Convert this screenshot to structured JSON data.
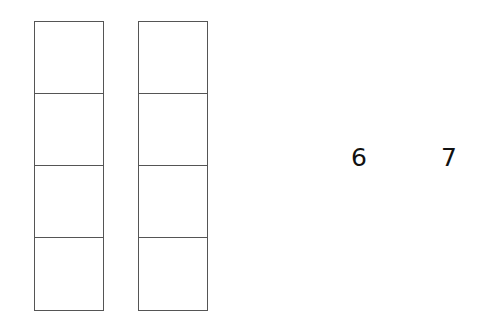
{
  "diagram": {
    "columns": [
      {
        "id": "column-1",
        "cells": 4
      },
      {
        "id": "column-2",
        "cells": 4
      }
    ],
    "numbers": [
      "6",
      "7"
    ],
    "colors": {
      "stroke": "#555555",
      "text": "#111111",
      "background": "#ffffff"
    }
  }
}
